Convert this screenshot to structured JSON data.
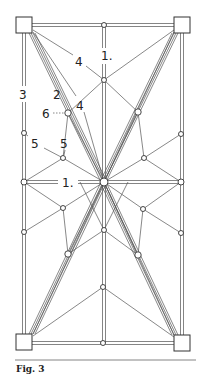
{
  "figure": {
    "caption": "Fig. 3",
    "colors": {
      "line": "#555555",
      "stroke_dark": "#333333",
      "background": "#ffffff"
    }
  },
  "labels": {
    "top_one": "1.",
    "four_upper": "4",
    "four_lower": "4",
    "three": "3",
    "two": "2",
    "six": "6",
    "five_left": "5",
    "five_right": "5",
    "one_mid": "1."
  },
  "corners": [
    {
      "id": "top-left",
      "x": 16,
      "y": 17,
      "size": 16
    },
    {
      "id": "top-right",
      "x": 174,
      "y": 17,
      "size": 16
    },
    {
      "id": "bottom-left",
      "x": 16,
      "y": 334,
      "size": 16
    },
    {
      "id": "bottom-right",
      "x": 174,
      "y": 335,
      "size": 16
    }
  ],
  "nodes": [
    {
      "id": "top-center",
      "x": 104,
      "y": 25
    },
    {
      "id": "upper-hub",
      "x": 104,
      "y": 80
    },
    {
      "id": "node-6",
      "x": 68,
      "y": 113
    },
    {
      "id": "upper-right",
      "x": 138,
      "y": 112
    },
    {
      "id": "left-edge-upper",
      "x": 24,
      "y": 133
    },
    {
      "id": "right-edge-upper",
      "x": 181,
      "y": 134
    },
    {
      "id": "inner-upper-left",
      "x": 63,
      "y": 158
    },
    {
      "id": "inner-upper-right",
      "x": 144,
      "y": 158
    },
    {
      "id": "left-mid",
      "x": 24,
      "y": 182
    },
    {
      "id": "center",
      "x": 104,
      "y": 182
    },
    {
      "id": "right-mid",
      "x": 181,
      "y": 182
    },
    {
      "id": "inner-lower-left",
      "x": 63,
      "y": 208
    },
    {
      "id": "inner-lower-right",
      "x": 143,
      "y": 209
    },
    {
      "id": "center-lower",
      "x": 104,
      "y": 230
    },
    {
      "id": "left-edge-lower",
      "x": 24,
      "y": 232
    },
    {
      "id": "right-edge-lower",
      "x": 181,
      "y": 233
    },
    {
      "id": "lower-left",
      "x": 68,
      "y": 254
    },
    {
      "id": "lower-right",
      "x": 138,
      "y": 255
    },
    {
      "id": "lower-hub",
      "x": 103,
      "y": 287
    },
    {
      "id": "bottom-center",
      "x": 103,
      "y": 343
    }
  ]
}
